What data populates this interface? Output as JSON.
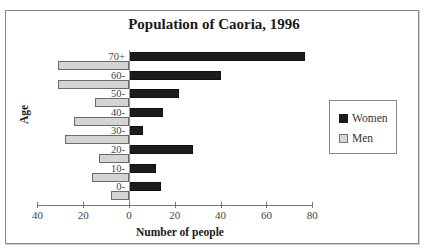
{
  "chart_data": {
    "type": "bar",
    "orientation": "horizontal",
    "title": "Population of Caoria, 1996",
    "xlabel": "Number of people",
    "ylabel": "Age",
    "categories": [
      "70+",
      "60-",
      "50-",
      "40-",
      "30-",
      "20-",
      "10-",
      "0-"
    ],
    "series": [
      {
        "name": "Women",
        "color": "#1c1c1c",
        "values": [
          77,
          40,
          22,
          15,
          6,
          28,
          12,
          14
        ]
      },
      {
        "name": "Men",
        "color": "#d4d4d4",
        "values": [
          31,
          31,
          15,
          24,
          28,
          13,
          16,
          8
        ]
      }
    ],
    "x_ticks": [
      -40,
      -20,
      0,
      20,
      40,
      60,
      80
    ],
    "x_tick_labels": [
      "40",
      "20",
      "0",
      "20",
      "40",
      "60",
      "80"
    ],
    "xlim": [
      -40,
      80
    ],
    "grid": false,
    "legend_position": "right"
  },
  "legend": {
    "women": "Women",
    "men": "Men"
  }
}
